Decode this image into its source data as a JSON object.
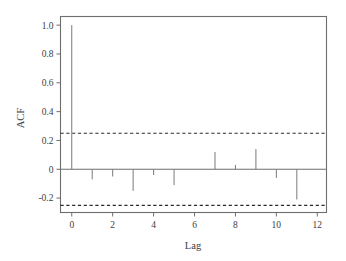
{
  "figure": {
    "background_color": "#ffffff",
    "frame_color": "#6e6e6e",
    "spike_color": "#7a7a7a",
    "conf_color": "#2b2b2b"
  },
  "axes": {
    "y_title": "ACF",
    "x_title": "Lag",
    "y_ticks": [
      "1.0",
      "0.8",
      "0.6",
      "0.4",
      "0.2",
      "0",
      "-0.2"
    ],
    "y_tick_values": [
      1.0,
      0.8,
      0.6,
      0.4,
      0.2,
      0.0,
      -0.2
    ],
    "x_ticks": [
      "0",
      "2",
      "4",
      "6",
      "8",
      "10",
      "12"
    ],
    "x_tick_values": [
      0,
      2,
      4,
      6,
      8,
      10,
      12
    ]
  },
  "chart_data": {
    "type": "bar",
    "title": "",
    "subtitle": "",
    "xlabel": "Lag",
    "ylabel": "ACF",
    "xlim": [
      -0.55,
      12.45
    ],
    "ylim": [
      -0.3,
      1.06
    ],
    "grid": false,
    "legend": null,
    "categories": [
      0,
      1,
      2,
      3,
      4,
      5,
      6,
      7,
      8,
      9,
      10,
      11,
      12
    ],
    "values": [
      1.0,
      -0.07,
      -0.05,
      -0.15,
      -0.04,
      -0.11,
      0.0,
      0.12,
      0.03,
      0.14,
      -0.06,
      -0.21,
      0.0
    ],
    "series": [
      {
        "name": "ACF",
        "values": [
          1.0,
          -0.07,
          -0.05,
          -0.15,
          -0.04,
          -0.11,
          0.0,
          0.12,
          0.03,
          0.14,
          -0.06,
          -0.21,
          0.0
        ]
      }
    ],
    "annotations": [
      {
        "name": "upper-confidence-band",
        "value": 0.25,
        "style": "dashed"
      },
      {
        "name": "lower-confidence-band",
        "value": -0.25,
        "style": "dashed"
      },
      {
        "name": "zero-reference-line",
        "value": 0.0,
        "style": "solid"
      }
    ]
  }
}
